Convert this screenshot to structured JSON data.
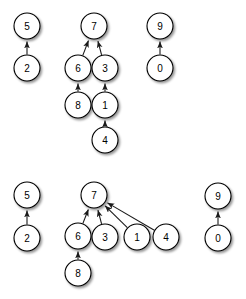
{
  "figure": {
    "background_color": "#ffffff",
    "node_fill": "#ffffff",
    "node_stroke": "#000000",
    "edge_color": "#1a1a1a",
    "node_radius": 13,
    "width": 246,
    "height": 299
  },
  "chart_data": {
    "type": "diagram",
    "title": "",
    "subtitle": "",
    "xlabel": "",
    "ylabel": "",
    "graph_kind": "directed-graph",
    "panels": [
      {
        "name": "top-panel",
        "nodes": [
          {
            "id": "t5",
            "label": "5",
            "x": 27,
            "y": 26
          },
          {
            "id": "t2",
            "label": "2",
            "x": 27,
            "y": 68
          },
          {
            "id": "t7",
            "label": "7",
            "x": 94,
            "y": 26
          },
          {
            "id": "t6",
            "label": "6",
            "x": 78,
            "y": 68
          },
          {
            "id": "t3",
            "label": "3",
            "x": 105,
            "y": 68
          },
          {
            "id": "t8",
            "label": "8",
            "x": 78,
            "y": 105
          },
          {
            "id": "t1",
            "label": "1",
            "x": 105,
            "y": 105
          },
          {
            "id": "t4",
            "label": "4",
            "x": 105,
            "y": 140
          },
          {
            "id": "t9",
            "label": "9",
            "x": 160,
            "y": 26
          },
          {
            "id": "t0",
            "label": "0",
            "x": 160,
            "y": 68
          }
        ],
        "edges": [
          {
            "from": "t2",
            "to": "t5"
          },
          {
            "from": "t6",
            "to": "t7"
          },
          {
            "from": "t3",
            "to": "t7"
          },
          {
            "from": "t8",
            "to": "t6"
          },
          {
            "from": "t1",
            "to": "t3"
          },
          {
            "from": "t4",
            "to": "t1"
          },
          {
            "from": "t0",
            "to": "t9"
          }
        ]
      },
      {
        "name": "bottom-panel",
        "nodes": [
          {
            "id": "b5",
            "label": "5",
            "x": 27,
            "y": 195
          },
          {
            "id": "b2",
            "label": "2",
            "x": 27,
            "y": 238
          },
          {
            "id": "b7",
            "label": "7",
            "x": 94,
            "y": 195
          },
          {
            "id": "b6",
            "label": "6",
            "x": 78,
            "y": 236
          },
          {
            "id": "b3",
            "label": "3",
            "x": 105,
            "y": 237
          },
          {
            "id": "b1",
            "label": "1",
            "x": 137,
            "y": 237
          },
          {
            "id": "b4",
            "label": "4",
            "x": 166,
            "y": 237
          },
          {
            "id": "b8",
            "label": "8",
            "x": 78,
            "y": 273
          },
          {
            "id": "b9",
            "label": "9",
            "x": 218,
            "y": 196
          },
          {
            "id": "b0",
            "label": "0",
            "x": 218,
            "y": 238
          }
        ],
        "edges": [
          {
            "from": "b2",
            "to": "b5"
          },
          {
            "from": "b6",
            "to": "b7"
          },
          {
            "from": "b3",
            "to": "b7"
          },
          {
            "from": "b1",
            "to": "b7"
          },
          {
            "from": "b4",
            "to": "b7"
          },
          {
            "from": "b8",
            "to": "b6"
          },
          {
            "from": "b0",
            "to": "b9"
          }
        ]
      }
    ]
  }
}
